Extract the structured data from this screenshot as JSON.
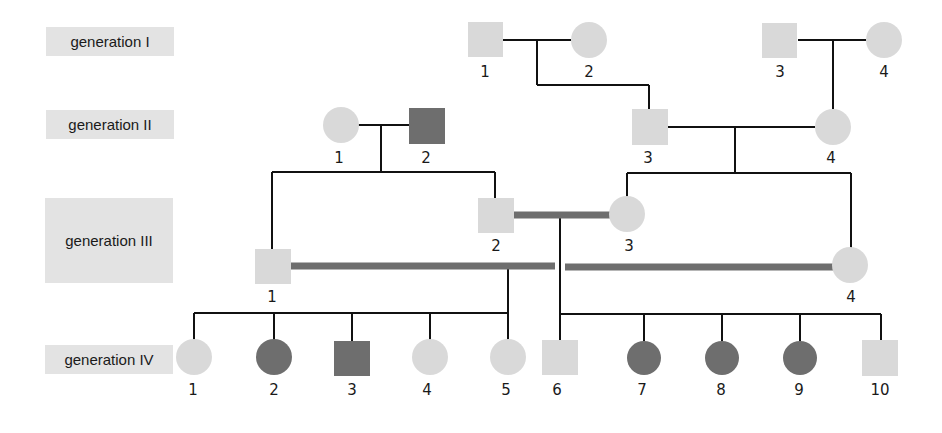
{
  "colors": {
    "unaffected": "#d9d9d9",
    "affected": "#6e6e6e",
    "line": "#111111",
    "consanguineous_line": "#6e6e6e",
    "label_bg": "#e3e3e3"
  },
  "generations": [
    {
      "id": "I",
      "label": "generation I"
    },
    {
      "id": "II",
      "label": "generation II"
    },
    {
      "id": "III",
      "label": "generation III"
    },
    {
      "id": "IV",
      "label": "generation IV"
    }
  ],
  "individuals": {
    "I": [
      {
        "n": "1",
        "sex": "male",
        "affected": false
      },
      {
        "n": "2",
        "sex": "female",
        "affected": false
      },
      {
        "n": "3",
        "sex": "male",
        "affected": false
      },
      {
        "n": "4",
        "sex": "female",
        "affected": false
      }
    ],
    "II": [
      {
        "n": "1",
        "sex": "female",
        "affected": false
      },
      {
        "n": "2",
        "sex": "male",
        "affected": true
      },
      {
        "n": "3",
        "sex": "male",
        "affected": false
      },
      {
        "n": "4",
        "sex": "female",
        "affected": false
      }
    ],
    "III": [
      {
        "n": "1",
        "sex": "male",
        "affected": false
      },
      {
        "n": "2",
        "sex": "male",
        "affected": false
      },
      {
        "n": "3",
        "sex": "female",
        "affected": false
      },
      {
        "n": "4",
        "sex": "female",
        "affected": false
      }
    ],
    "IV": [
      {
        "n": "1",
        "sex": "female",
        "affected": false
      },
      {
        "n": "2",
        "sex": "female",
        "affected": true
      },
      {
        "n": "3",
        "sex": "male",
        "affected": true
      },
      {
        "n": "4",
        "sex": "female",
        "affected": false
      },
      {
        "n": "5",
        "sex": "female",
        "affected": false
      },
      {
        "n": "6",
        "sex": "male",
        "affected": false
      },
      {
        "n": "7",
        "sex": "female",
        "affected": true
      },
      {
        "n": "8",
        "sex": "female",
        "affected": true
      },
      {
        "n": "9",
        "sex": "female",
        "affected": true
      },
      {
        "n": "10",
        "sex": "male",
        "affected": false
      }
    ]
  },
  "matings": [
    {
      "partners": [
        "I-1",
        "I-2"
      ],
      "consanguineous": false,
      "children": [
        "II-3"
      ]
    },
    {
      "partners": [
        "I-3",
        "I-4"
      ],
      "consanguineous": false,
      "children": [
        "II-4"
      ]
    },
    {
      "partners": [
        "II-1",
        "II-2"
      ],
      "consanguineous": false,
      "children": [
        "III-1",
        "III-2"
      ]
    },
    {
      "partners": [
        "II-3",
        "II-4"
      ],
      "consanguineous": false,
      "children": [
        "III-3",
        "III-4"
      ]
    },
    {
      "partners": [
        "III-2",
        "III-3"
      ],
      "consanguineous": true,
      "children": [
        "IV-6",
        "IV-7",
        "IV-8",
        "IV-9",
        "IV-10"
      ]
    },
    {
      "partners": [
        "III-1",
        "III-4"
      ],
      "consanguineous": true,
      "children": [
        "IV-1",
        "IV-2",
        "IV-3",
        "IV-4",
        "IV-5"
      ]
    }
  ]
}
